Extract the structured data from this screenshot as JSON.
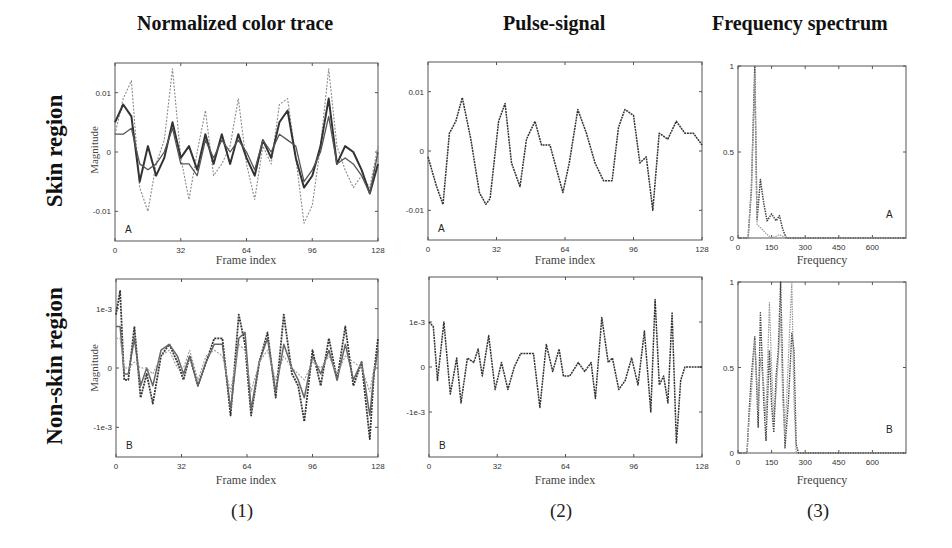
{
  "columns": [
    {
      "title": "Normalized color trace",
      "panel": "(1)"
    },
    {
      "title": "Pulse-signal",
      "panel": "(2)"
    },
    {
      "title": "Frequency spectrum",
      "panel": "(3)"
    }
  ],
  "rows": [
    {
      "label": "Skin  region",
      "letter": "A"
    },
    {
      "label": "Non-skin  region",
      "letter": "B"
    }
  ],
  "axes": {
    "ylabel": "Magnitude",
    "time_xlabel": "Frame index",
    "freq_xlabel": "Frequency",
    "time_xticks": [
      "0",
      "32",
      "64",
      "96",
      "128"
    ],
    "freq_xticks": [
      "0",
      "150",
      "300",
      "450",
      "600"
    ],
    "skin_yticks": [
      "0.01",
      "0",
      "-0.01"
    ],
    "nonskin_yticks": [
      "1e-3",
      "0",
      "-1e-3"
    ],
    "spec_yticks": [
      "1",
      "0.5",
      "0"
    ]
  },
  "chart_data": [
    {
      "type": "line",
      "title": "Normalized color trace",
      "subtitle": "Skin region (A)",
      "xlabel": "Frame index",
      "ylabel": "Magnitude",
      "xlim": [
        0,
        128
      ],
      "ylim": [
        -0.015,
        0.015
      ],
      "x": [
        0,
        4,
        8,
        12,
        16,
        20,
        24,
        28,
        32,
        36,
        40,
        44,
        48,
        52,
        56,
        60,
        64,
        68,
        72,
        76,
        80,
        84,
        88,
        92,
        96,
        100,
        104,
        108,
        112,
        116,
        120,
        124,
        128
      ],
      "series": [
        {
          "name": "trace-1 (dotted, light)",
          "values": [
            0.003,
            0.009,
            0.012,
            -0.006,
            -0.01,
            -0.002,
            0.002,
            0.014,
            -0.001,
            -0.008,
            0.0,
            0.007,
            -0.004,
            -0.002,
            0.001,
            0.009,
            -0.002,
            -0.008,
            0.001,
            -0.002,
            0.008,
            0.009,
            -0.001,
            -0.012,
            -0.009,
            0.001,
            0.014,
            0.001,
            -0.003,
            -0.006,
            -0.004,
            -0.006,
            0.001
          ]
        },
        {
          "name": "trace-2 (solid, dark)",
          "values": [
            0.005,
            0.008,
            0.006,
            -0.005,
            0.001,
            -0.004,
            -0.001,
            0.005,
            -0.001,
            0.001,
            -0.003,
            0.003,
            -0.002,
            0.003,
            -0.002,
            0.003,
            -0.001,
            -0.004,
            0.002,
            -0.001,
            0.005,
            0.007,
            -0.001,
            -0.006,
            -0.004,
            0.001,
            0.009,
            -0.002,
            0.001,
            0.0,
            -0.003,
            -0.007,
            -0.002
          ]
        },
        {
          "name": "trace-3 (solid, medium)",
          "values": [
            0.003,
            0.003,
            0.004,
            -0.002,
            -0.003,
            -0.002,
            0.0,
            0.004,
            -0.002,
            -0.002,
            -0.004,
            0.002,
            -0.001,
            0.002,
            0.0,
            0.002,
            0.0,
            -0.003,
            0.002,
            0.0,
            0.003,
            0.002,
            0.001,
            -0.005,
            -0.003,
            0.0,
            0.006,
            -0.002,
            -0.001,
            -0.002,
            -0.004,
            -0.007,
            0.0
          ]
        }
      ]
    },
    {
      "type": "line",
      "title": "Pulse-signal",
      "subtitle": "Skin region (A)",
      "xlabel": "Frame index",
      "ylabel": "",
      "xlim": [
        0,
        128
      ],
      "ylim": [
        -0.015,
        0.015
      ],
      "x": [
        0,
        4,
        7,
        10,
        13,
        16,
        20,
        24,
        27,
        29,
        33,
        36,
        39,
        43,
        46,
        50,
        53,
        57,
        60,
        63,
        66,
        70,
        74,
        78,
        82,
        86,
        89,
        92,
        96,
        99,
        102,
        105,
        108,
        112,
        116,
        120,
        124,
        128
      ],
      "series": [
        {
          "name": "pulse",
          "values": [
            -0.001,
            -0.006,
            -0.009,
            0.003,
            0.005,
            0.009,
            0.002,
            -0.007,
            -0.009,
            -0.008,
            0.005,
            0.008,
            -0.002,
            -0.006,
            0.002,
            0.005,
            0.001,
            0.001,
            -0.003,
            -0.007,
            -0.002,
            0.007,
            0.003,
            -0.002,
            -0.005,
            -0.005,
            0.004,
            0.007,
            0.006,
            -0.002,
            -0.001,
            -0.01,
            0.003,
            0.002,
            0.005,
            0.003,
            0.003,
            0.001
          ]
        }
      ]
    },
    {
      "type": "line",
      "title": "Frequency spectrum",
      "subtitle": "Skin region (A)",
      "xlabel": "Frequency",
      "ylabel": "",
      "xlim": [
        0,
        750
      ],
      "ylim": [
        0,
        1
      ],
      "x": [
        0,
        45,
        60,
        75,
        85,
        100,
        115,
        130,
        150,
        170,
        185,
        200,
        215,
        230,
        245,
        260,
        275,
        300,
        450,
        600,
        750
      ],
      "series": [
        {
          "name": "spectrum-1 (dark dotted)",
          "values": [
            0,
            0,
            0.28,
            1.0,
            0.1,
            0.34,
            0.2,
            0.1,
            0.14,
            0.1,
            0.13,
            0.05,
            0.0,
            0,
            0,
            0,
            0,
            0,
            0,
            0,
            0
          ]
        },
        {
          "name": "spectrum-2 (light dotted)",
          "values": [
            0,
            0,
            0.3,
            0.95,
            0.08,
            0.06,
            0.04,
            0.02,
            0.0,
            0.01,
            0.02,
            0.01,
            0.0,
            0,
            0,
            0,
            0,
            0,
            0,
            0,
            0
          ]
        }
      ]
    },
    {
      "type": "line",
      "title": "Normalized color trace",
      "subtitle": "Non-skin region (B)",
      "xlabel": "Frame index",
      "ylabel": "Magnitude",
      "xlim": [
        0,
        128
      ],
      "ylim": [
        -0.0015,
        0.0015
      ],
      "x": [
        0,
        2,
        4,
        6,
        9,
        12,
        15,
        18,
        22,
        26,
        30,
        33,
        36,
        40,
        44,
        48,
        52,
        56,
        60,
        63,
        66,
        70,
        74,
        78,
        82,
        86,
        89,
        92,
        96,
        100,
        104,
        108,
        112,
        116,
        120,
        124,
        126,
        128
      ],
      "series": [
        {
          "name": "trace-1 (dark)",
          "values": [
            0.0009,
            0.0013,
            -0.0002,
            -0.0002,
            0.0007,
            -0.0005,
            -0.0001,
            -0.0006,
            0.0002,
            0.0004,
            0.0001,
            -0.0002,
            0.0002,
            -0.0003,
            0.0001,
            0.0005,
            0.0005,
            -0.0008,
            0.0009,
            0.0004,
            -0.0008,
            0.0001,
            0.0006,
            -0.0005,
            0.0009,
            -0.0001,
            -0.0003,
            -0.0009,
            0.0003,
            -0.0003,
            0.0005,
            -0.0002,
            0.0007,
            -0.0003,
            0.0001,
            -0.0012,
            -0.0001,
            0.0005
          ]
        },
        {
          "name": "trace-2 (medium)",
          "values": [
            0.0007,
            0.0007,
            -0.0001,
            -0.0001,
            0.0005,
            -0.0003,
            0.0,
            -0.0003,
            0.0003,
            0.0004,
            0.0002,
            -0.0001,
            0.0002,
            -0.0003,
            0.0001,
            0.0004,
            0.0004,
            -0.0007,
            0.0005,
            0.0006,
            -0.0007,
            0.0001,
            0.0005,
            -0.0004,
            0.0004,
            0.0,
            -0.0002,
            -0.0005,
            0.0002,
            -0.0001,
            0.0003,
            -0.0002,
            0.0004,
            -0.0002,
            0.0001,
            -0.0008,
            -0.0001,
            0.0003
          ]
        },
        {
          "name": "trace-3 (light)",
          "values": [
            0.0005,
            0.0005,
            0.0,
            0.0,
            0.0001,
            0.0,
            0.0,
            -0.0001,
            0.0002,
            0.0003,
            0.0,
            0.0,
            0.0003,
            -0.0002,
            0.0002,
            0.0003,
            0.0002,
            -0.0004,
            0.0004,
            0.0003,
            -0.0004,
            0.0001,
            0.0003,
            -0.0002,
            0.0002,
            0.0,
            -0.0001,
            -0.0002,
            0.0001,
            0.0,
            0.0002,
            -0.0001,
            0.0002,
            0.0001,
            0.0,
            -0.0004,
            0.0,
            0.0001
          ]
        }
      ]
    },
    {
      "type": "line",
      "title": "Pulse-signal",
      "subtitle": "Non-skin region (B)",
      "xlabel": "Frame index",
      "ylabel": "",
      "xlim": [
        0,
        128
      ],
      "ylim": [
        -0.002,
        0.002
      ],
      "x": [
        0,
        2,
        4,
        7,
        10,
        13,
        15,
        18,
        21,
        23,
        25,
        28,
        31,
        34,
        37,
        40,
        43,
        46,
        49,
        52,
        55,
        58,
        61,
        63,
        66,
        70,
        73,
        76,
        78,
        81,
        84,
        86,
        89,
        92,
        95,
        98,
        101,
        104,
        106,
        108,
        110,
        112,
        114,
        116,
        118,
        120,
        122,
        124,
        126,
        128
      ],
      "series": [
        {
          "name": "pulse",
          "values": [
            0.001,
            0.0009,
            -0.0003,
            0.001,
            -0.0006,
            0.0002,
            -0.0008,
            0.0002,
            0.0001,
            0.0004,
            -0.0002,
            0.0007,
            -0.0005,
            0.0001,
            -0.0005,
            0.0,
            0.0003,
            0.0003,
            0.0003,
            -0.0009,
            0.0005,
            -0.0001,
            0.0004,
            -0.0002,
            -0.0002,
            0.0001,
            -0.0001,
            0.0001,
            -0.0007,
            0.0011,
            0.0001,
            0.0002,
            -0.0005,
            -0.0003,
            0.0002,
            -0.0004,
            0.0008,
            -0.001,
            0.0015,
            -0.0004,
            -0.0002,
            -0.0008,
            0.0012,
            -0.0017,
            -0.0003,
            0.0,
            0.0,
            0.0,
            0.0,
            0.0
          ]
        }
      ]
    },
    {
      "type": "line",
      "title": "Frequency spectrum",
      "subtitle": "Non-skin region (B)",
      "xlabel": "Frequency",
      "ylabel": "",
      "xlim": [
        0,
        750
      ],
      "ylim": [
        0,
        1
      ],
      "x": [
        0,
        40,
        50,
        60,
        75,
        90,
        100,
        115,
        125,
        140,
        150,
        160,
        170,
        180,
        190,
        200,
        210,
        225,
        240,
        250,
        260,
        270,
        300,
        450,
        600,
        750
      ],
      "series": [
        {
          "name": "spectrum-1 (dark dotted)",
          "values": [
            0,
            0,
            0.25,
            0.45,
            0.68,
            0.15,
            0.82,
            0.3,
            0.07,
            0.6,
            0.28,
            0.12,
            0.45,
            0.6,
            1.0,
            0.45,
            0.03,
            0.3,
            0.7,
            0.6,
            0.05,
            0.0,
            0,
            0,
            0,
            0
          ]
        },
        {
          "name": "spectrum-2 (light dotted)",
          "values": [
            0,
            0,
            0.2,
            0.35,
            0.66,
            0.25,
            0.55,
            0.4,
            0.2,
            0.88,
            0.5,
            0.2,
            0.35,
            0.55,
            0.8,
            0.3,
            0.1,
            0.55,
            1.0,
            0.3,
            0.0,
            0.0,
            0,
            0,
            0,
            0
          ]
        }
      ]
    }
  ]
}
